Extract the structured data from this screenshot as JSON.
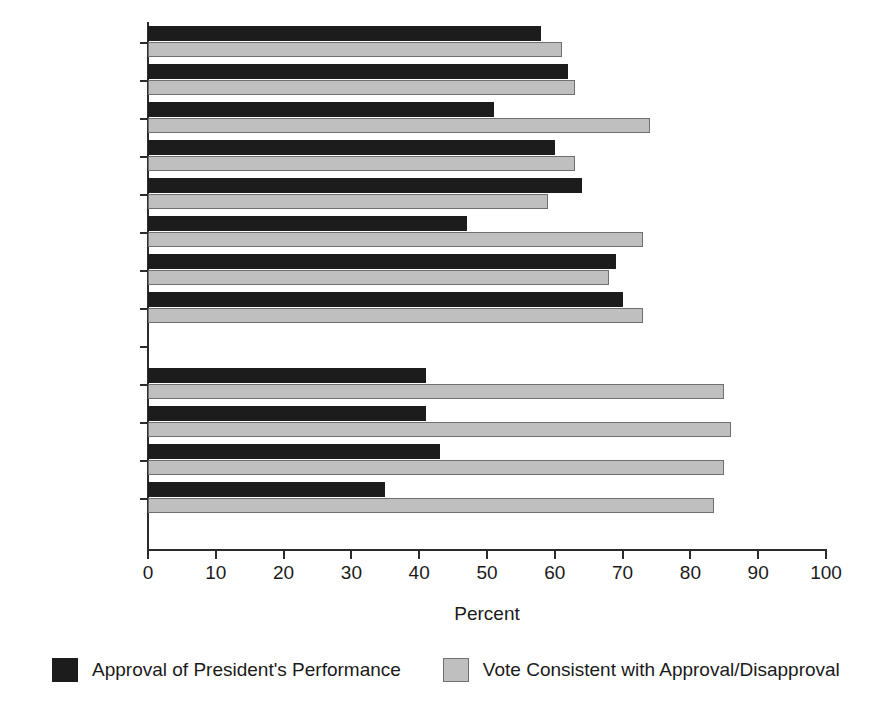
{
  "chart_data": {
    "type": "bar",
    "orientation": "horizontal",
    "title": "",
    "xlabel": "Percent",
    "ylabel": "",
    "xlim": [
      0,
      100
    ],
    "xticks": [
      0,
      10,
      20,
      30,
      40,
      50,
      60,
      70,
      80,
      90,
      100
    ],
    "grid": false,
    "legend_position": "bottom",
    "categories": [
      "1974 NES",
      "1978 NES",
      "1982 NES",
      "1986 NES",
      "1990 NES",
      "1994 NES",
      "1998 NES",
      "2002 NES",
      "",
      "2006 CCES",
      "CES",
      "Exit Poll",
      "NES Pilot"
    ],
    "series": [
      {
        "name": "Approval of President's Performance",
        "color": "#1c1c1c",
        "values": [
          58,
          62,
          51,
          60,
          64,
          47,
          69,
          70,
          null,
          41,
          41,
          43,
          35
        ]
      },
      {
        "name": "Vote Consistent with Approval/Disapproval",
        "color": "#bfbfbf",
        "values": [
          61,
          63,
          74,
          63,
          59,
          73,
          68,
          73,
          null,
          85,
          86,
          85,
          83.5
        ]
      }
    ]
  },
  "axis": {
    "x_title": "Percent",
    "tick_labels": [
      "0",
      "10",
      "20",
      "30",
      "40",
      "50",
      "60",
      "70",
      "80",
      "90",
      "100"
    ]
  },
  "legend": {
    "items": [
      {
        "label": "Approval of President's Performance",
        "swatch": "series-a"
      },
      {
        "label": "Vote Consistent with Approval/Disapproval",
        "swatch": "series-b"
      }
    ]
  }
}
